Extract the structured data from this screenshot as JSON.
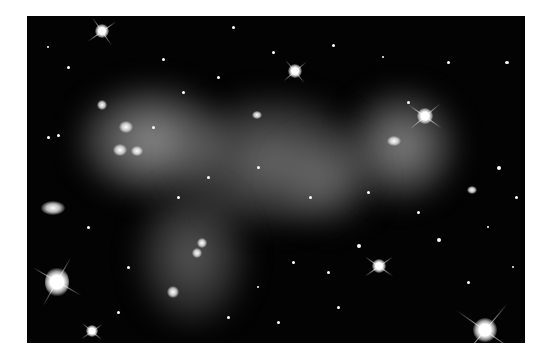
{
  "image": {
    "subject": "galaxy cluster with diffuse intracluster light",
    "background_color": "#030303",
    "page_background": "#ffffff",
    "glow_color": "#bdbdbd"
  }
}
